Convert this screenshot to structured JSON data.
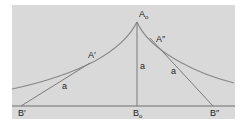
{
  "diagram": {
    "type": "tractrix",
    "colors": {
      "background": "#d9d9d9",
      "curve": "#8a8a8a",
      "lines": "#7a7a7a",
      "text": "#222222"
    },
    "points": {
      "apex": {
        "label": "A",
        "sub": "o"
      },
      "left_touch": {
        "label": "A′"
      },
      "right_touch": {
        "label": "A″"
      },
      "left_base": {
        "label": "B′"
      },
      "center_base": {
        "label": "B",
        "sub": "o"
      },
      "right_base": {
        "label": "B″"
      }
    },
    "segment_labels": {
      "left": "a",
      "center": "a",
      "right": "a"
    }
  }
}
